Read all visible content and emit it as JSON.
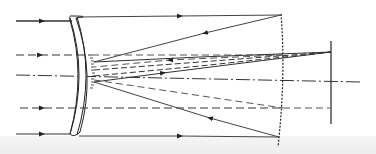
{
  "diagram": {
    "type": "optical-ray-diagram",
    "colors": {
      "background": "#ffffff",
      "line": "#333333",
      "dashed": "#555555",
      "strip": "#eeeeee"
    },
    "elements": [
      {
        "name": "meniscus-lens",
        "label": ""
      },
      {
        "name": "secondary-mirror",
        "label": ""
      },
      {
        "name": "primary-mirror",
        "label": ""
      },
      {
        "name": "image-plane",
        "label": ""
      },
      {
        "name": "optical-axis",
        "label": ""
      }
    ],
    "incoming_rays": [
      {
        "y": 16,
        "style": "solid"
      },
      {
        "y": 55,
        "style": "dashed"
      },
      {
        "y": 75,
        "style": "dash-dot"
      },
      {
        "y": 108,
        "style": "dashed"
      },
      {
        "y": 134,
        "style": "solid"
      }
    ],
    "labels": []
  }
}
